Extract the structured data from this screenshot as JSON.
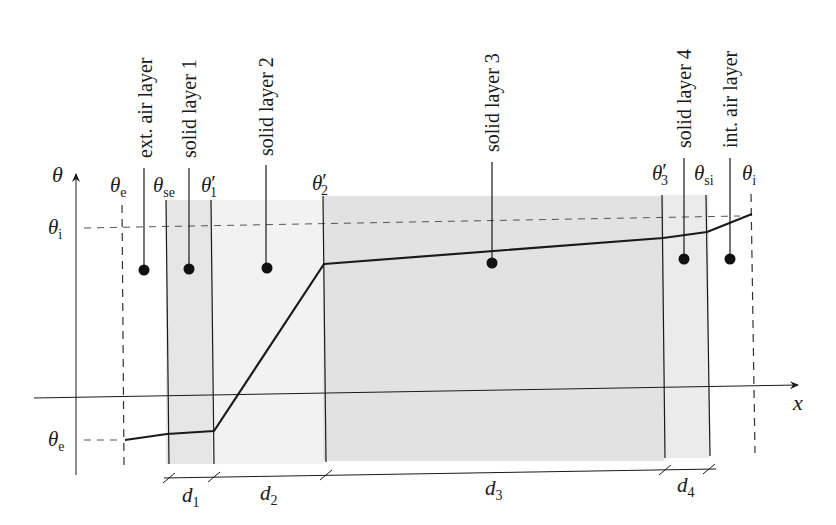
{
  "diagram": {
    "axes": {
      "y_label": "θ",
      "x_label": "x",
      "y_ticks": [
        {
          "label": "θ",
          "sub": "i",
          "prime": ""
        },
        {
          "label": "θ",
          "sub": "e",
          "prime": ""
        }
      ]
    },
    "layers": [
      {
        "name": "ext. air layer"
      },
      {
        "name": "solid layer 1"
      },
      {
        "name": "solid layer 2"
      },
      {
        "name": "solid layer 3"
      },
      {
        "name": "solid layer 4"
      },
      {
        "name": "int. air layer"
      }
    ],
    "interface_temps": [
      {
        "label": "θ",
        "sub": "e",
        "prime": ""
      },
      {
        "label": "θ",
        "sub": "se",
        "prime": ""
      },
      {
        "label": "θ",
        "sub": "1",
        "prime": "′"
      },
      {
        "label": "θ",
        "sub": "2",
        "prime": "′"
      },
      {
        "label": "θ",
        "sub": "3",
        "prime": "′"
      },
      {
        "label": "θ",
        "sub": "si",
        "prime": ""
      },
      {
        "label": "θ",
        "sub": "i",
        "prime": ""
      }
    ],
    "thicknesses": [
      {
        "label": "d",
        "sub": "1"
      },
      {
        "label": "d",
        "sub": "2"
      },
      {
        "label": "d",
        "sub": "3"
      },
      {
        "label": "d",
        "sub": "4"
      }
    ],
    "colors": {
      "line": "#1a1a1a",
      "shade_dark": "#e2e2e2",
      "shade_light": "#f1f1f1",
      "dashed": "#555555"
    }
  }
}
